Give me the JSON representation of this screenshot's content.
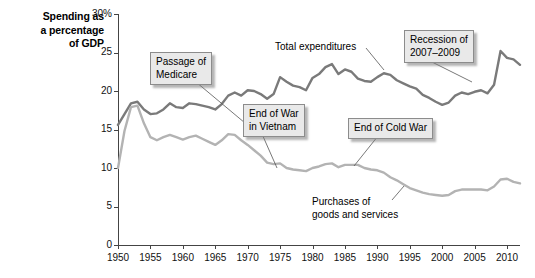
{
  "chart_data": {
    "type": "line",
    "title": "",
    "ylabel": "Spending as a percentage of GDP",
    "xlabel": "",
    "ylabel_lines": [
      "Spending as",
      "a percentage",
      "of GDP"
    ],
    "grid": false,
    "legend": "inline-annotations",
    "xlim": [
      1950,
      2012
    ],
    "ylim": [
      0,
      30
    ],
    "y_ticks": [
      "0",
      "5",
      "10",
      "15",
      "20",
      "25",
      "30%"
    ],
    "y_tick_values": [
      0,
      5,
      10,
      15,
      20,
      25,
      30
    ],
    "x_ticks": [
      "1950",
      "1955",
      "1960",
      "1965",
      "1970",
      "1975",
      "1980",
      "1985",
      "1990",
      "1995",
      "2000",
      "2005",
      "2010"
    ],
    "x_tick_values": [
      1950,
      1955,
      1960,
      1965,
      1970,
      1975,
      1980,
      1985,
      1990,
      1995,
      2000,
      2005,
      2010
    ],
    "series": [
      {
        "name": "Total expenditures",
        "color": "#7a7a7a",
        "x": [
          1950,
          1951,
          1952,
          1953,
          1954,
          1955,
          1956,
          1957,
          1958,
          1959,
          1960,
          1961,
          1962,
          1963,
          1964,
          1965,
          1966,
          1967,
          1968,
          1969,
          1970,
          1971,
          1972,
          1973,
          1974,
          1975,
          1976,
          1977,
          1978,
          1979,
          1980,
          1981,
          1982,
          1983,
          1984,
          1985,
          1986,
          1987,
          1988,
          1989,
          1990,
          1991,
          1992,
          1993,
          1994,
          1995,
          1996,
          1997,
          1998,
          1999,
          2000,
          2001,
          2002,
          2003,
          2004,
          2005,
          2006,
          2007,
          2008,
          2009,
          2010,
          2011,
          2012
        ],
        "values": [
          15.6,
          17.0,
          18.4,
          18.6,
          17.6,
          17.0,
          17.1,
          17.6,
          18.4,
          17.9,
          17.8,
          18.4,
          18.3,
          18.1,
          17.9,
          17.6,
          18.3,
          19.4,
          19.8,
          19.4,
          20.1,
          20.0,
          19.6,
          19.0,
          19.6,
          21.8,
          21.2,
          20.7,
          20.5,
          20.1,
          21.7,
          22.2,
          23.1,
          23.5,
          22.2,
          22.8,
          22.5,
          21.6,
          21.3,
          21.2,
          21.8,
          22.3,
          22.1,
          21.4,
          21.0,
          20.6,
          20.3,
          19.5,
          19.1,
          18.6,
          18.2,
          18.5,
          19.4,
          19.8,
          19.6,
          19.9,
          20.1,
          19.7,
          20.8,
          25.2,
          24.3,
          24.1,
          23.4
        ]
      },
      {
        "name": "Purchases of goods and services",
        "color": "#b3b3b3",
        "x": [
          1950,
          1951,
          1952,
          1953,
          1954,
          1955,
          1956,
          1957,
          1958,
          1959,
          1960,
          1961,
          1962,
          1963,
          1964,
          1965,
          1966,
          1967,
          1968,
          1969,
          1970,
          1971,
          1972,
          1973,
          1974,
          1975,
          1976,
          1977,
          1978,
          1979,
          1980,
          1981,
          1982,
          1983,
          1984,
          1985,
          1986,
          1987,
          1988,
          1989,
          1990,
          1991,
          1992,
          1993,
          1994,
          1995,
          1996,
          1997,
          1998,
          1999,
          2000,
          2001,
          2002,
          2003,
          2004,
          2005,
          2006,
          2007,
          2008,
          2009,
          2010,
          2011,
          2012
        ],
        "values": [
          10.0,
          14.8,
          17.9,
          18.1,
          15.8,
          14.0,
          13.6,
          14.0,
          14.3,
          14.0,
          13.7,
          14.0,
          14.2,
          13.8,
          13.4,
          13.0,
          13.6,
          14.4,
          14.3,
          13.6,
          13.0,
          12.3,
          11.6,
          10.7,
          10.5,
          10.6,
          10.0,
          9.8,
          9.7,
          9.6,
          10.0,
          10.2,
          10.5,
          10.6,
          10.1,
          10.4,
          10.4,
          10.4,
          10.0,
          9.8,
          9.7,
          9.4,
          8.8,
          8.4,
          7.9,
          7.4,
          7.1,
          6.8,
          6.6,
          6.5,
          6.4,
          6.5,
          7.0,
          7.2,
          7.2,
          7.2,
          7.2,
          7.1,
          7.6,
          8.5,
          8.6,
          8.2,
          8.0
        ]
      }
    ],
    "annotations": [
      {
        "id": "passage-of-medicare",
        "text": "Passage of\nMedicare",
        "style": "callout",
        "target_year": 1965
      },
      {
        "id": "end-of-war-in-vietnam",
        "text": "End of War\nin Vietnam",
        "style": "callout",
        "target_year": 1973
      },
      {
        "id": "end-of-cold-war",
        "text": "End of Cold War",
        "style": "callout",
        "target_year": 1991
      },
      {
        "id": "recession-of-2007-2009",
        "text": "Recession of\n2007–2009",
        "style": "callout",
        "target_year": 2009
      },
      {
        "id": "total-expenditures",
        "text": "Total expenditures",
        "style": "plain",
        "target_year": 1984
      },
      {
        "id": "purchases-of-goods-and-services",
        "text": "Purchases of\ngoods and services",
        "style": "plain",
        "target_year": 1997
      }
    ]
  },
  "axis": {
    "y_title_line1": "Spending as",
    "y_title_line2": "a percentage",
    "y_title_line3": "of GDP"
  },
  "colors": {
    "total_line": "#7a7a7a",
    "purchases_line": "#b3b3b3",
    "axis": "#444444",
    "callout_fill": "#e9e9e9",
    "callout_border": "#8c8c8c",
    "text": "#000000"
  }
}
